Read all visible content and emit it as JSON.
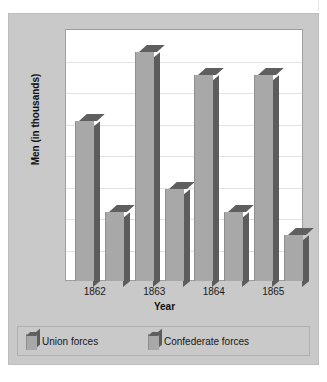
{
  "figure": {
    "background_color": "#c9c9c9",
    "plot_background_color": "#ffffff",
    "top_cropped_caption": "",
    "frame_border_color": "#bdbdbd"
  },
  "legend": {
    "position": "bottom",
    "entries": [
      {
        "label": "Union forces",
        "color": "#a8a8a8"
      },
      {
        "label": "Confederate forces",
        "color": "#a8a8a8"
      }
    ]
  },
  "chart_data": {
    "type": "bar",
    "title": "",
    "xlabel": "Year",
    "ylabel": "Men (in thousands)",
    "categories": [
      "1862",
      "1863",
      "1864",
      "1865"
    ],
    "series": [
      {
        "name": "Union forces",
        "values": [
          700,
          1000,
          900,
          900
        ],
        "color": "#a8a8a8"
      },
      {
        "name": "Confederate forces",
        "values": [
          300,
          400,
          300,
          200
        ],
        "color": "#a8a8a8"
      }
    ],
    "ylim": [
      0,
      1100
    ],
    "yticks": [],
    "ytick_labels": [],
    "gridlines": 7,
    "grid": true,
    "grid_color": "#e3e3e3",
    "style": "3d-column",
    "legend_position": "bottom"
  }
}
